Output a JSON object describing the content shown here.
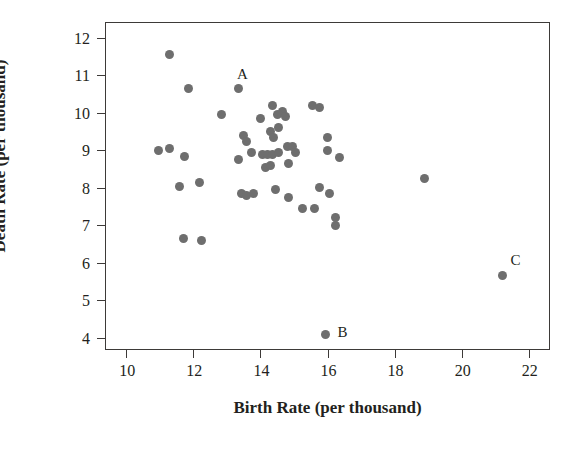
{
  "chart_data": {
    "type": "scatter",
    "title": "",
    "xlabel": "Birth Rate (per thousand)",
    "ylabel": "Death Rate (per thousand)",
    "xlim": [
      9.4,
      22.6
    ],
    "ylim": [
      3.7,
      12.4
    ],
    "xticks": [
      10,
      12,
      14,
      16,
      18,
      20,
      22
    ],
    "yticks": [
      4,
      5,
      6,
      7,
      8,
      9,
      10,
      11,
      12
    ],
    "grid": false,
    "legend": null,
    "marker": {
      "shape": "circle",
      "color": "#6e6e6e",
      "size_px": 9
    },
    "frame_color": "#3d3a38",
    "annotations": [
      {
        "text": "A",
        "x": 13.3,
        "y": 11.0,
        "point_x": 13.35,
        "point_y": 10.65
      },
      {
        "text": "B",
        "x": 16.3,
        "y": 4.12,
        "point_x": 15.95,
        "point_y": 4.1
      },
      {
        "text": "C",
        "x": 21.45,
        "y": 6.05,
        "point_x": 21.2,
        "point_y": 5.65
      }
    ],
    "points": [
      {
        "x": 11.3,
        "y": 11.55
      },
      {
        "x": 11.85,
        "y": 10.65
      },
      {
        "x": 13.35,
        "y": 10.65,
        "label": "A"
      },
      {
        "x": 12.85,
        "y": 9.95
      },
      {
        "x": 14.35,
        "y": 10.2
      },
      {
        "x": 14.65,
        "y": 10.05
      },
      {
        "x": 15.55,
        "y": 10.2
      },
      {
        "x": 15.75,
        "y": 10.15
      },
      {
        "x": 14.0,
        "y": 9.85
      },
      {
        "x": 14.5,
        "y": 9.95
      },
      {
        "x": 14.75,
        "y": 9.9
      },
      {
        "x": 13.5,
        "y": 9.4
      },
      {
        "x": 13.6,
        "y": 9.25
      },
      {
        "x": 14.3,
        "y": 9.5
      },
      {
        "x": 14.4,
        "y": 9.35
      },
      {
        "x": 14.55,
        "y": 9.6
      },
      {
        "x": 16.0,
        "y": 9.35
      },
      {
        "x": 10.95,
        "y": 9.0
      },
      {
        "x": 11.3,
        "y": 9.05
      },
      {
        "x": 11.75,
        "y": 8.85
      },
      {
        "x": 13.35,
        "y": 8.75
      },
      {
        "x": 13.75,
        "y": 8.95
      },
      {
        "x": 14.05,
        "y": 8.9
      },
      {
        "x": 14.2,
        "y": 8.9
      },
      {
        "x": 14.35,
        "y": 8.9
      },
      {
        "x": 14.55,
        "y": 8.95
      },
      {
        "x": 14.8,
        "y": 9.1
      },
      {
        "x": 14.95,
        "y": 9.1
      },
      {
        "x": 15.05,
        "y": 8.95
      },
      {
        "x": 16.35,
        "y": 8.8
      },
      {
        "x": 14.15,
        "y": 8.55
      },
      {
        "x": 14.3,
        "y": 8.6
      },
      {
        "x": 14.85,
        "y": 8.65
      },
      {
        "x": 16.0,
        "y": 9.0
      },
      {
        "x": 11.6,
        "y": 8.05
      },
      {
        "x": 12.2,
        "y": 8.15
      },
      {
        "x": 13.45,
        "y": 7.85
      },
      {
        "x": 13.6,
        "y": 7.8
      },
      {
        "x": 13.8,
        "y": 7.85
      },
      {
        "x": 14.45,
        "y": 7.95
      },
      {
        "x": 14.85,
        "y": 7.75
      },
      {
        "x": 15.75,
        "y": 8.0
      },
      {
        "x": 16.05,
        "y": 7.85
      },
      {
        "x": 15.25,
        "y": 7.45
      },
      {
        "x": 15.6,
        "y": 7.45
      },
      {
        "x": 16.25,
        "y": 7.2
      },
      {
        "x": 16.25,
        "y": 7.0
      },
      {
        "x": 11.7,
        "y": 6.65
      },
      {
        "x": 12.25,
        "y": 6.6
      },
      {
        "x": 18.9,
        "y": 8.25
      },
      {
        "x": 21.2,
        "y": 5.65,
        "label": "C"
      },
      {
        "x": 15.95,
        "y": 4.1,
        "label": "B"
      }
    ]
  }
}
